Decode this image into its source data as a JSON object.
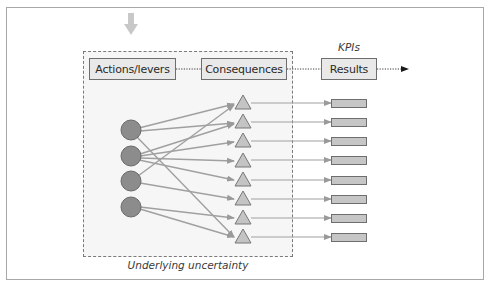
{
  "diagram": {
    "stages": [
      {
        "label": "Actions/levers"
      },
      {
        "label": "Consequences"
      },
      {
        "label": "Results"
      }
    ],
    "kpi_label": "KPIs",
    "uncertainty_caption": "Underlying uncertainty",
    "levers_count": 4,
    "consequences_count": 8,
    "results_count": 8,
    "connections": [
      {
        "from_lever": 1,
        "to_consequence": 1
      },
      {
        "from_lever": 1,
        "to_consequence": 2
      },
      {
        "from_lever": 1,
        "to_consequence": 8
      },
      {
        "from_lever": 2,
        "to_consequence": 2
      },
      {
        "from_lever": 2,
        "to_consequence": 3
      },
      {
        "from_lever": 2,
        "to_consequence": 4
      },
      {
        "from_lever": 2,
        "to_consequence": 5
      },
      {
        "from_lever": 3,
        "to_consequence": 1
      },
      {
        "from_lever": 3,
        "to_consequence": 6
      },
      {
        "from_lever": 4,
        "to_consequence": 7
      },
      {
        "from_lever": 4,
        "to_consequence": 8
      }
    ],
    "colors": {
      "lever_fill": "#8c8c8c",
      "consequence_fill": "#c4c4c4",
      "result_fill": "#c6c6c6",
      "arrow": "#a0a0a0",
      "input_arrow": "#c8c8c8"
    }
  }
}
